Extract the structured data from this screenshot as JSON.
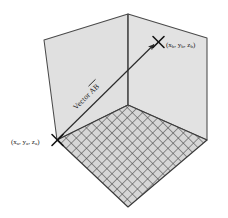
{
  "diagram": {
    "background_color": "#ffffff",
    "wall_fill": "#e0e0e0",
    "floor_fill": "#d2d2d2",
    "line_color": "#3a3a3a",
    "text_color": "#1a1a1a",
    "walls": {
      "back_left_name": "back-left-wall",
      "back_right_name": "back-right-wall",
      "floor_name": "floor-grid-plane"
    },
    "vector": {
      "label_prefix": "Vector ",
      "label_name": "AB",
      "overline": true,
      "from_point": "A",
      "to_point": "B"
    },
    "points": [
      {
        "id": "A",
        "marker": "x-marker",
        "label": "(x",
        "sub": "a",
        "label_full": "(xa, ya, za)",
        "parts": [
          {
            "text": "(x",
            "sub": "a"
          },
          {
            "text": ", y",
            "sub": "a"
          },
          {
            "text": ", z",
            "sub": "a"
          },
          {
            "text": ")",
            "sub": ""
          }
        ]
      },
      {
        "id": "B",
        "marker": "x-marker",
        "label": "(x",
        "sub": "b",
        "label_full": "(xb, yb, zb)",
        "parts": [
          {
            "text": "(x",
            "sub": "b"
          },
          {
            "text": ", y",
            "sub": "b"
          },
          {
            "text": ", z",
            "sub": "b"
          },
          {
            "text": ")",
            "sub": ""
          }
        ]
      }
    ]
  }
}
